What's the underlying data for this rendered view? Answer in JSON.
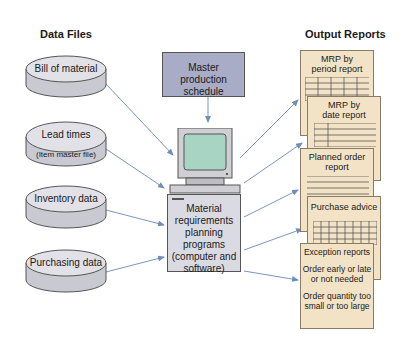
{
  "headings": {
    "data_files": "Data Files",
    "output_reports": "Output Reports"
  },
  "data_files": [
    {
      "label": "Bill of material"
    },
    {
      "label": "Lead times",
      "sublabel": "(Item master file)"
    },
    {
      "label": "Inventory data"
    },
    {
      "label": "Purchasing data"
    }
  ],
  "center": {
    "mps_line1": "Master",
    "mps_line2": "production schedule",
    "mrp_lines": [
      "Material",
      "requirements",
      "planning",
      "programs",
      "(computer and",
      "software)"
    ]
  },
  "reports": {
    "period": {
      "line1": "MRP by",
      "line2": "period report"
    },
    "date": {
      "line1": "MRP by",
      "line2": "date report"
    },
    "planned": {
      "line1": "Planned order",
      "line2": "report"
    },
    "purchase": {
      "line1": "Purchase advice"
    },
    "exception": {
      "title": "Exception reports",
      "item1_line1": "Order early or late",
      "item1_line2": "or not needed",
      "item2_line1": "Order quantity too",
      "item2_line2": "small or too large"
    }
  },
  "colors": {
    "arrow": "#6f8fb8",
    "document": "#f2e3c6",
    "mps_box": "#a9acc6",
    "cylinder": "#d6d6dc",
    "screen": "#a8d4c4"
  }
}
